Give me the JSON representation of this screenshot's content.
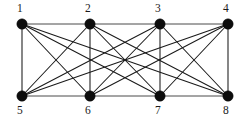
{
  "figure": {
    "name": "bipartite-graph-k44-with-rails",
    "width": 247,
    "height": 123,
    "background_color": "#ffffff",
    "node_color": "#0d0d0d",
    "edge_color": "#1a1a1a",
    "rail_color": "#4a4a4a",
    "node_radius": 5.2
  },
  "vertices": [
    {
      "id": 1,
      "label": "1",
      "x": 22,
      "y": 24,
      "label_x": 17,
      "label_y": 3,
      "row": "top"
    },
    {
      "id": 2,
      "label": "2",
      "x": 90,
      "y": 24,
      "label_x": 85,
      "label_y": 3,
      "row": "top"
    },
    {
      "id": 3,
      "label": "3",
      "x": 160,
      "y": 24,
      "label_x": 155,
      "label_y": 3,
      "row": "top"
    },
    {
      "id": 4,
      "label": "4",
      "x": 228,
      "y": 24,
      "label_x": 223,
      "label_y": 3,
      "row": "top"
    },
    {
      "id": 5,
      "label": "5",
      "x": 22,
      "y": 96,
      "label_x": 17,
      "label_y": 105,
      "row": "bottom"
    },
    {
      "id": 6,
      "label": "6",
      "x": 90,
      "y": 96,
      "label_x": 85,
      "label_y": 105,
      "row": "bottom"
    },
    {
      "id": 7,
      "label": "7",
      "x": 160,
      "y": 96,
      "label_x": 155,
      "label_y": 105,
      "row": "bottom"
    },
    {
      "id": 8,
      "label": "8",
      "x": 228,
      "y": 96,
      "label_x": 223,
      "label_y": 105,
      "row": "bottom"
    }
  ],
  "edges": [
    {
      "from": 1,
      "to": 2,
      "kind": "rail"
    },
    {
      "from": 2,
      "to": 3,
      "kind": "rail"
    },
    {
      "from": 3,
      "to": 4,
      "kind": "rail"
    },
    {
      "from": 5,
      "to": 6,
      "kind": "rail"
    },
    {
      "from": 6,
      "to": 7,
      "kind": "rail"
    },
    {
      "from": 7,
      "to": 8,
      "kind": "rail"
    },
    {
      "from": 1,
      "to": 5,
      "kind": "bipartite"
    },
    {
      "from": 1,
      "to": 6,
      "kind": "bipartite"
    },
    {
      "from": 1,
      "to": 7,
      "kind": "bipartite"
    },
    {
      "from": 1,
      "to": 8,
      "kind": "bipartite"
    },
    {
      "from": 2,
      "to": 5,
      "kind": "bipartite"
    },
    {
      "from": 2,
      "to": 6,
      "kind": "bipartite"
    },
    {
      "from": 2,
      "to": 7,
      "kind": "bipartite"
    },
    {
      "from": 2,
      "to": 8,
      "kind": "bipartite"
    },
    {
      "from": 3,
      "to": 5,
      "kind": "bipartite"
    },
    {
      "from": 3,
      "to": 6,
      "kind": "bipartite"
    },
    {
      "from": 3,
      "to": 7,
      "kind": "bipartite"
    },
    {
      "from": 3,
      "to": 8,
      "kind": "bipartite"
    },
    {
      "from": 4,
      "to": 5,
      "kind": "bipartite"
    },
    {
      "from": 4,
      "to": 6,
      "kind": "bipartite"
    },
    {
      "from": 4,
      "to": 7,
      "kind": "bipartite"
    },
    {
      "from": 4,
      "to": 8,
      "kind": "bipartite"
    }
  ]
}
